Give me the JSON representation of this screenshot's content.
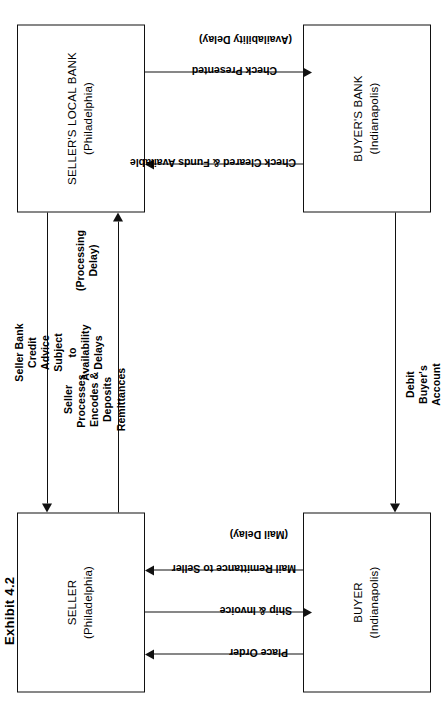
{
  "exhibit": {
    "label": "Exhibit 4.2"
  },
  "diagram": {
    "title": "Exhibit 4.2",
    "type": "flow-diagram",
    "orientation": "rotated-90-ccw",
    "nodes": [
      {
        "id": "seller",
        "name": "SELLER",
        "city": "(Philadelphia)"
      },
      {
        "id": "seller_bank",
        "name": "SELLER'S LOCAL BANK",
        "city": "(Philadelphia)"
      },
      {
        "id": "buyer",
        "name": "BUYER",
        "city": "(Indianapolis)"
      },
      {
        "id": "buyer_bank",
        "name": "BUYER'S BANK",
        "city": "(Indianapolis)"
      }
    ],
    "flows": [
      {
        "id": "place_order",
        "from": "buyer",
        "to": "seller",
        "label": "Place Order"
      },
      {
        "id": "ship_invoice",
        "from": "seller",
        "to": "buyer",
        "label": "Ship & Invoice"
      },
      {
        "id": "mail_remittance",
        "from": "buyer",
        "to": "seller",
        "label": "Mail Remittance to Seller",
        "delay": "(Mail Delay)"
      },
      {
        "id": "seller_processes",
        "from": "seller",
        "to": "seller_bank",
        "label": "Seller\nProcesses,\nEncodes &\nDeposits\nRemittances",
        "delay": "(Processing\nDelay)"
      },
      {
        "id": "credit_advice",
        "from": "seller_bank",
        "to": "seller",
        "label": "Seller Bank\nCredit\nAdvice\nSubject\nto\nAvailability\nDelays"
      },
      {
        "id": "check_presented",
        "from": "seller_bank",
        "to": "buyer_bank",
        "label": "Check Presented",
        "delay": "(Availability Delay)"
      },
      {
        "id": "check_cleared",
        "from": "buyer_bank",
        "to": "seller_bank",
        "label": "Check Cleared & Funds Available"
      },
      {
        "id": "debit_account",
        "from": "buyer_bank",
        "to": "buyer",
        "label": "Debit\nBuyer's\nAccount"
      }
    ]
  }
}
